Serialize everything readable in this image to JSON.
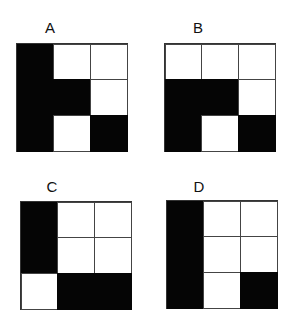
{
  "figure": {
    "panels": [
      {
        "label": "A",
        "label_pos": [
          40,
          20
        ],
        "grid_pos": [
          16,
          43
        ],
        "cells": [
          [
            1,
            0,
            0
          ],
          [
            1,
            1,
            0
          ],
          [
            1,
            0,
            1
          ]
        ]
      },
      {
        "label": "B",
        "label_pos": [
          188,
          20
        ],
        "grid_pos": [
          164,
          43
        ],
        "cells": [
          [
            0,
            0,
            0
          ],
          [
            1,
            1,
            0
          ],
          [
            1,
            0,
            1
          ]
        ]
      },
      {
        "label": "C",
        "label_pos": [
          42,
          179
        ],
        "grid_pos": [
          20,
          201
        ],
        "cells": [
          [
            1,
            0,
            0
          ],
          [
            1,
            0,
            0
          ],
          [
            0,
            1,
            1
          ]
        ]
      },
      {
        "label": "D",
        "label_pos": [
          189,
          179
        ],
        "grid_pos": [
          166,
          200
        ],
        "cells": [
          [
            1,
            0,
            0
          ],
          [
            1,
            0,
            0
          ],
          [
            1,
            0,
            1
          ]
        ]
      }
    ],
    "colors": {
      "filled": "#050505",
      "empty": "#ffffff",
      "border": "#444444"
    }
  }
}
